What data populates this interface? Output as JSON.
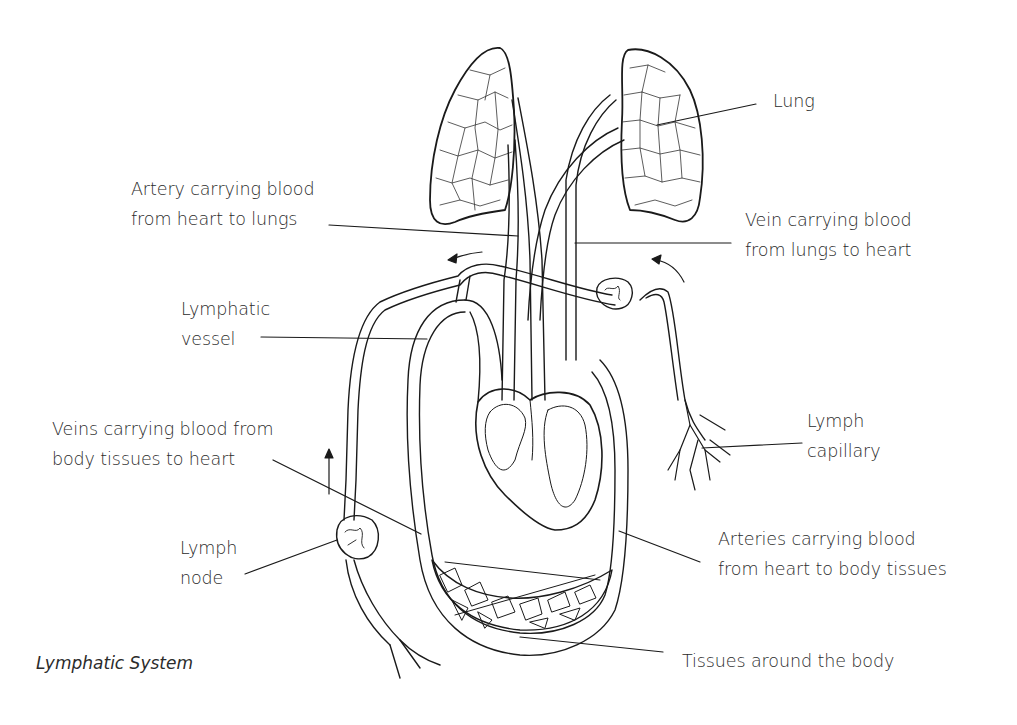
{
  "diagram": {
    "title": "Lymphatic System",
    "type": "anatomical line drawing",
    "colors": {
      "ink": "#1a1a1a",
      "text": "#2b2b2b",
      "background": "#ffffff"
    },
    "labels": {
      "lung": {
        "lines": [
          "Lung"
        ]
      },
      "artery_to_lungs": {
        "lines": [
          "Artery carrying blood",
          "from heart to lungs"
        ]
      },
      "vein_from_lungs": {
        "lines": [
          "Vein carrying blood",
          "from lungs to heart"
        ]
      },
      "lymphatic_vessel": {
        "lines": [
          "Lymphatic",
          "vessel"
        ]
      },
      "veins_from_body": {
        "lines": [
          "Veins carrying blood from",
          "body tissues to heart"
        ]
      },
      "lymph_capillary": {
        "lines": [
          "Lymph",
          "capillary"
        ]
      },
      "lymph_node": {
        "lines": [
          "Lymph",
          "node"
        ]
      },
      "arteries_to_body": {
        "lines": [
          "Arteries carrying blood",
          "from heart to body tissues"
        ]
      },
      "tissues": {
        "lines": [
          "Tissues around the body"
        ]
      }
    },
    "flow_arrows": [
      "left-arrow-top",
      "curved-arrow-right",
      "up-arrow-left"
    ]
  }
}
